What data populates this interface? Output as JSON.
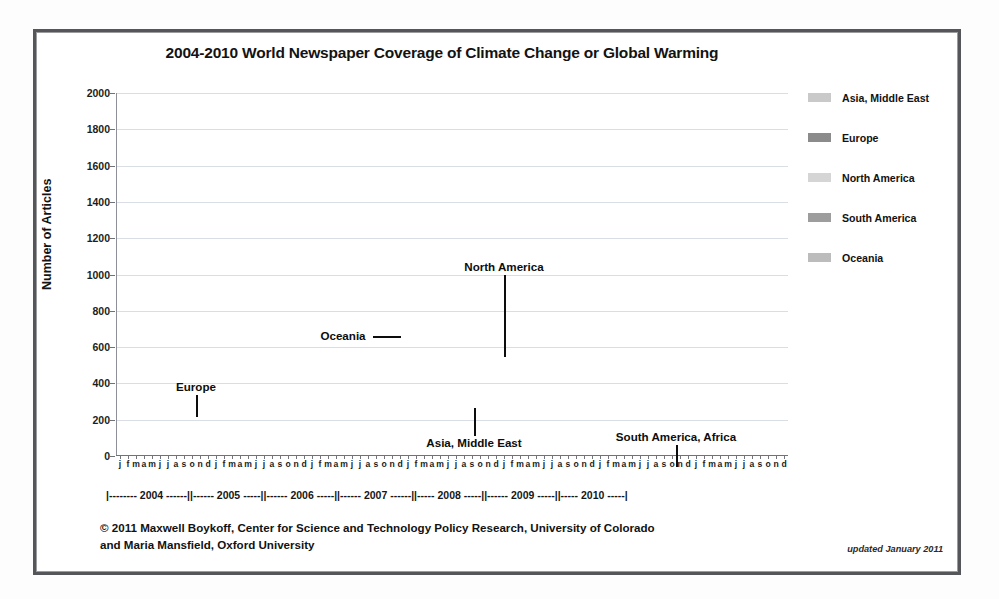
{
  "figure": {
    "title": "2004-2010 World Newspaper Coverage of Climate Change or Global Warming",
    "credit_line_1": "© 2011 Maxwell Boykoff, Center for Science and Technology Policy Research, University of Colorado",
    "credit_line_2": "and Maria Mansfield, Oxford University",
    "updated_note": "updated January 2011"
  },
  "legend": {
    "position": "right",
    "items": [
      {
        "label": "Asia, Middle East",
        "color": "#c9c9c9",
        "swatch": "legend-swatch-asia"
      },
      {
        "label": "Europe",
        "color": "#8b8b8b",
        "swatch": "legend-swatch-europe"
      },
      {
        "label": "North America",
        "color": "#d5d5d5",
        "swatch": "legend-swatch-north-america"
      },
      {
        "label": "South America",
        "color": "#9d9d9d",
        "swatch": "legend-swatch-south-america"
      },
      {
        "label": "Oceania",
        "color": "#bcbcbc",
        "swatch": "legend-swatch-oceania"
      }
    ]
  },
  "annotations": [
    {
      "text": "Europe",
      "x": 196,
      "y": 380,
      "leader": "down",
      "leader_len": 22
    },
    {
      "text": "Oceania",
      "x": 343,
      "y": 329,
      "leader": "right",
      "leader_len": 28
    },
    {
      "text": "North America",
      "x": 504,
      "y": 260,
      "leader": "down-long",
      "leader_len": 82
    },
    {
      "text": "Asia, Middle East",
      "x": 474,
      "y": 436,
      "leader": "up",
      "leader_len": 28
    },
    {
      "text": "South America, Africa",
      "x": 676,
      "y": 430,
      "leader": "down",
      "leader_len": 22
    }
  ],
  "axes": {
    "y_title": "Number of Articles",
    "y_ticks": [
      0,
      200,
      400,
      600,
      800,
      1000,
      1200,
      1400,
      1600,
      1800,
      2000
    ],
    "y_min": 0,
    "y_max": 2000,
    "month_initials": [
      "j",
      "f",
      "m",
      "a",
      "m",
      "j",
      "j",
      "a",
      "s",
      "o",
      "n",
      "d"
    ],
    "year_band": "|-------- 2004 ------||------ 2005 -----||------ 2006 -----||------ 2007 ------||----- 2008 -----||------ 2009 -----||----- 2010 -----|",
    "years": [
      2004,
      2005,
      2006,
      2007,
      2008,
      2009,
      2010
    ],
    "grid": true
  },
  "chart_data": {
    "type": "line",
    "title": "2004-2010 World Newspaper Coverage of Climate Change or Global Warming",
    "xlabel": "",
    "ylabel": "Number of Articles",
    "ylim": [
      0,
      2000
    ],
    "x_start": "2004-01",
    "x_end": "2010-12",
    "n_points": 84,
    "x": [
      "2004-01",
      "2004-02",
      "2004-03",
      "2004-04",
      "2004-05",
      "2004-06",
      "2004-07",
      "2004-08",
      "2004-09",
      "2004-10",
      "2004-11",
      "2004-12",
      "2005-01",
      "2005-02",
      "2005-03",
      "2005-04",
      "2005-05",
      "2005-06",
      "2005-07",
      "2005-08",
      "2005-09",
      "2005-10",
      "2005-11",
      "2005-12",
      "2006-01",
      "2006-02",
      "2006-03",
      "2006-04",
      "2006-05",
      "2006-06",
      "2006-07",
      "2006-08",
      "2006-09",
      "2006-10",
      "2006-11",
      "2006-12",
      "2007-01",
      "2007-02",
      "2007-03",
      "2007-04",
      "2007-05",
      "2007-06",
      "2007-07",
      "2007-08",
      "2007-09",
      "2007-10",
      "2007-11",
      "2007-12",
      "2008-01",
      "2008-02",
      "2008-03",
      "2008-04",
      "2008-05",
      "2008-06",
      "2008-07",
      "2008-08",
      "2008-09",
      "2008-10",
      "2008-11",
      "2008-12",
      "2009-01",
      "2009-02",
      "2009-03",
      "2009-04",
      "2009-05",
      "2009-06",
      "2009-07",
      "2009-08",
      "2009-09",
      "2009-10",
      "2009-11",
      "2009-12",
      "2010-01",
      "2010-02",
      "2010-03",
      "2010-04",
      "2010-05",
      "2010-06",
      "2010-07",
      "2010-08",
      "2010-09",
      "2010-10",
      "2010-11",
      "2010-12"
    ],
    "series": [
      {
        "name": "Europe",
        "color": "#8b8b8b",
        "values": [
          110,
          150,
          185,
          170,
          160,
          215,
          330,
          230,
          185,
          260,
          250,
          230,
          225,
          290,
          310,
          270,
          265,
          300,
          305,
          250,
          285,
          300,
          320,
          470,
          420,
          400,
          420,
          455,
          470,
          555,
          520,
          455,
          545,
          660,
          700,
          745,
          680,
          1000,
          1040,
          830,
          915,
          1125,
          930,
          790,
          1065,
          905,
          1055,
          1100,
          900,
          905,
          1100,
          880,
          860,
          630,
          660,
          650,
          640,
          700,
          760,
          1135,
          700,
          560,
          720,
          790,
          650,
          620,
          600,
          700,
          690,
          720,
          1000,
          1820,
          740,
          560,
          540,
          470,
          600,
          600,
          455,
          420,
          420,
          460,
          480,
          600
        ]
      },
      {
        "name": "North America",
        "color": "#d5d5d5",
        "values": [
          95,
          130,
          150,
          140,
          130,
          180,
          270,
          200,
          170,
          225,
          215,
          200,
          195,
          250,
          270,
          240,
          235,
          265,
          270,
          225,
          255,
          265,
          290,
          420,
          375,
          360,
          380,
          405,
          415,
          490,
          460,
          405,
          485,
          590,
          625,
          665,
          610,
          890,
          925,
          740,
          815,
          1000,
          830,
          705,
          950,
          810,
          940,
          980,
          800,
          805,
          980,
          785,
          765,
          560,
          590,
          580,
          570,
          625,
          680,
          1010,
          625,
          500,
          640,
          705,
          580,
          550,
          535,
          625,
          615,
          640,
          890,
          1620,
          660,
          500,
          480,
          420,
          535,
          535,
          405,
          375,
          375,
          410,
          430,
          535
        ]
      },
      {
        "name": "Oceania",
        "color": "#bcbcbc",
        "values": [
          65,
          90,
          105,
          100,
          95,
          125,
          190,
          140,
          120,
          160,
          150,
          140,
          140,
          175,
          190,
          170,
          165,
          185,
          190,
          160,
          180,
          190,
          205,
          295,
          265,
          255,
          270,
          285,
          295,
          345,
          325,
          285,
          340,
          415,
          440,
          470,
          430,
          625,
          650,
          520,
          575,
          705,
          585,
          495,
          665,
          570,
          660,
          690,
          565,
          565,
          690,
          550,
          540,
          395,
          415,
          410,
          400,
          440,
          480,
          710,
          440,
          350,
          450,
          495,
          410,
          390,
          375,
          440,
          435,
          450,
          625,
          1140,
          465,
          350,
          340,
          295,
          375,
          375,
          285,
          265,
          265,
          290,
          300,
          375
        ]
      },
      {
        "name": "Asia, Middle East",
        "color": "#c9c9c9",
        "values": [
          40,
          55,
          65,
          60,
          58,
          75,
          115,
          85,
          72,
          98,
          92,
          85,
          85,
          105,
          115,
          102,
          100,
          112,
          115,
          96,
          110,
          115,
          125,
          180,
          160,
          155,
          165,
          175,
          180,
          210,
          198,
          175,
          208,
          252,
          268,
          285,
          262,
          380,
          395,
          318,
          350,
          430,
          356,
          302,
          405,
          347,
          402,
          420,
          344,
          346,
          420,
          335,
          328,
          240,
          252,
          249,
          244,
          268,
          292,
          432,
          268,
          214,
          274,
          302,
          249,
          236,
          229,
          268,
          264,
          274,
          380,
          695,
          283,
          214,
          206,
          180,
          229,
          229,
          174,
          161,
          161,
          176,
          184,
          229
        ]
      },
      {
        "name": "South America, Africa",
        "color": "#9d9d9d",
        "values": [
          20,
          25,
          30,
          28,
          26,
          35,
          52,
          38,
          32,
          44,
          42,
          38,
          38,
          48,
          52,
          46,
          45,
          50,
          52,
          43,
          49,
          52,
          56,
          82,
          72,
          70,
          74,
          79,
          81,
          95,
          89,
          79,
          94,
          114,
          121,
          129,
          118,
          172,
          179,
          143,
          158,
          194,
          161,
          136,
          183,
          157,
          182,
          190,
          155,
          156,
          190,
          151,
          148,
          108,
          114,
          112,
          110,
          121,
          132,
          196,
          121,
          97,
          124,
          136,
          112,
          107,
          103,
          121,
          119,
          124,
          172,
          315,
          128,
          97,
          93,
          81,
          103,
          103,
          78,
          72,
          72,
          79,
          83,
          103
        ]
      }
    ]
  }
}
